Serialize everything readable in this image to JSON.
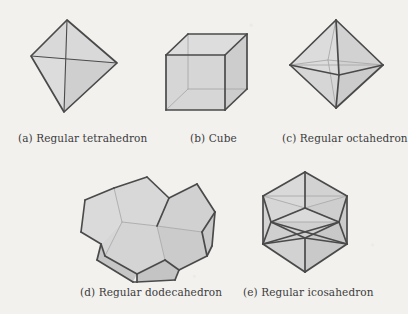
{
  "figure": {
    "kind": "platonic-solids-plate",
    "background_color": "#f2f1ee",
    "face_fill_color": "#d4d4d4",
    "face_fill_light_color": "#dcdcdc",
    "edge_color": "#4a4a4a",
    "hidden_edge_color": "#a9a9a9",
    "caption_color": "#3c3c3c"
  },
  "panels": [
    {
      "id": "tetrahedron",
      "label": "(a) Regular tetrahedron",
      "caption_x": 18,
      "caption_y": 132,
      "svg": {
        "x": 18,
        "y": 12,
        "w": 110,
        "h": 110
      },
      "faces": [
        {
          "points": "49,8 13,44 46,100",
          "shade": "#dcdcdc"
        },
        {
          "points": "49,8 46,100 99,51",
          "shade": "#cfcfcf"
        },
        {
          "points": "49,8 13,44 99,51",
          "shade": "#d9d9d9"
        }
      ],
      "inner_edges": [
        {
          "x1": 13,
          "y1": 44,
          "x2": 99,
          "y2": 51
        },
        {
          "x1": 49,
          "y1": 8,
          "x2": 46,
          "y2": 100
        }
      ],
      "outline": "49,8 13,44 46,100 99,51"
    },
    {
      "id": "cube",
      "label": "(b) Cube",
      "caption_x": 190,
      "caption_y": 132,
      "svg": {
        "x": 155,
        "y": 12,
        "w": 110,
        "h": 110
      },
      "faces": [
        {
          "points": "11,43 70,43 70,98 11,98",
          "shade": "#d6d6d6"
        },
        {
          "points": "11,43 33,22 92,22 70,43",
          "shade": "#dddddd"
        },
        {
          "points": "70,43 92,22 92,77 70,98",
          "shade": "#cdcdcd"
        }
      ],
      "hidden_edges": [
        {
          "x1": 33,
          "y1": 22,
          "x2": 33,
          "y2": 77
        },
        {
          "x1": 33,
          "y1": 77,
          "x2": 92,
          "y2": 77
        },
        {
          "x1": 33,
          "y1": 77,
          "x2": 11,
          "y2": 98
        }
      ],
      "edges": [
        {
          "x1": 11,
          "y1": 43,
          "x2": 70,
          "y2": 43
        },
        {
          "x1": 70,
          "y1": 43,
          "x2": 70,
          "y2": 98
        },
        {
          "x1": 70,
          "y1": 98,
          "x2": 11,
          "y2": 98
        },
        {
          "x1": 11,
          "y1": 98,
          "x2": 11,
          "y2": 43
        },
        {
          "x1": 11,
          "y1": 43,
          "x2": 33,
          "y2": 22
        },
        {
          "x1": 33,
          "y1": 22,
          "x2": 92,
          "y2": 22
        },
        {
          "x1": 92,
          "y1": 22,
          "x2": 92,
          "y2": 77
        },
        {
          "x1": 92,
          "y1": 77,
          "x2": 70,
          "y2": 98
        },
        {
          "x1": 70,
          "y1": 43,
          "x2": 92,
          "y2": 22
        }
      ]
    },
    {
      "id": "octahedron",
      "label": "(c) Regular octahedron",
      "caption_x": 282,
      "caption_y": 132,
      "svg": {
        "x": 282,
        "y": 12,
        "w": 110,
        "h": 110
      },
      "faces": [
        {
          "points": "54,8 8,53 57,63",
          "shade": "#dcdcdc"
        },
        {
          "points": "54,8 101,53 57,63",
          "shade": "#d2d2d2"
        },
        {
          "points": "54,96 8,53 57,63",
          "shade": "#d6d6d6"
        },
        {
          "points": "54,96 101,53 57,63",
          "shade": "#cccccc"
        }
      ],
      "hidden_edges": [
        {
          "x1": 8,
          "y1": 53,
          "x2": 101,
          "y2": 53
        },
        {
          "x1": 54,
          "y1": 8,
          "x2": 46,
          "y2": 48
        },
        {
          "x1": 54,
          "y1": 96,
          "x2": 46,
          "y2": 48
        },
        {
          "x1": 8,
          "y1": 53,
          "x2": 46,
          "y2": 48
        },
        {
          "x1": 101,
          "y1": 53,
          "x2": 46,
          "y2": 48
        }
      ],
      "edges": [
        {
          "x1": 54,
          "y1": 8,
          "x2": 8,
          "y2": 53
        },
        {
          "x1": 54,
          "y1": 8,
          "x2": 101,
          "y2": 53
        },
        {
          "x1": 54,
          "y1": 96,
          "x2": 8,
          "y2": 53
        },
        {
          "x1": 54,
          "y1": 96,
          "x2": 101,
          "y2": 53
        },
        {
          "x1": 54,
          "y1": 8,
          "x2": 57,
          "y2": 63
        },
        {
          "x1": 54,
          "y1": 96,
          "x2": 57,
          "y2": 63
        },
        {
          "x1": 8,
          "y1": 53,
          "x2": 57,
          "y2": 63
        },
        {
          "x1": 101,
          "y1": 53,
          "x2": 57,
          "y2": 63
        }
      ]
    },
    {
      "id": "dodecahedron",
      "label": "(d) Regular dodecahedron",
      "caption_x": 80,
      "caption_y": 286,
      "svg": {
        "x": 75,
        "y": 160,
        "w": 125,
        "h": 125
      },
      "faces": [
        {
          "points": "39,28 72,17 94,38 82,66 47,62",
          "shade": "#d8d8d8"
        },
        {
          "points": "94,38 122,24 140,52 127,72 82,66",
          "shade": "#d1d1d1"
        },
        {
          "points": "39,28 47,62 26,84 6,72 10,40",
          "shade": "#dadada"
        },
        {
          "points": "47,62 82,66 90,100 62,114 30,96",
          "shade": "#d4d4d4"
        },
        {
          "points": "82,66 127,72 132,96 104,110 90,100",
          "shade": "#cbcbcb"
        },
        {
          "points": "47,62 30,96 26,84",
          "shade": "#d6d6d6"
        },
        {
          "points": "26,84 30,96 62,114 58,122 22,100",
          "shade": "#c6c6c6"
        },
        {
          "points": "90,100 104,110 100,120 62,122 62,114",
          "shade": "#c4c4c4"
        },
        {
          "points": "127,72 140,52 137,86 132,96",
          "shade": "#c9c9c9"
        }
      ],
      "hidden_edges": [
        {
          "x1": 39,
          "y1": 28,
          "x2": 47,
          "y2": 62
        },
        {
          "x1": 47,
          "y1": 62,
          "x2": 82,
          "y2": 66
        },
        {
          "x1": 82,
          "y1": 66,
          "x2": 94,
          "y2": 38
        },
        {
          "x1": 82,
          "y1": 66,
          "x2": 127,
          "y2": 72
        },
        {
          "x1": 47,
          "y1": 62,
          "x2": 30,
          "y2": 96
        },
        {
          "x1": 90,
          "y1": 100,
          "x2": 82,
          "y2": 66
        }
      ],
      "edges": [
        {
          "x1": 39,
          "y1": 28,
          "x2": 72,
          "y2": 17
        },
        {
          "x1": 72,
          "y1": 17,
          "x2": 94,
          "y2": 38
        },
        {
          "x1": 94,
          "y1": 38,
          "x2": 122,
          "y2": 24
        },
        {
          "x1": 122,
          "y1": 24,
          "x2": 140,
          "y2": 52
        },
        {
          "x1": 140,
          "y1": 52,
          "x2": 137,
          "y2": 86
        },
        {
          "x1": 137,
          "y1": 86,
          "x2": 132,
          "y2": 96
        },
        {
          "x1": 132,
          "y1": 96,
          "x2": 104,
          "y2": 110
        },
        {
          "x1": 104,
          "y1": 110,
          "x2": 100,
          "y2": 120
        },
        {
          "x1": 100,
          "y1": 120,
          "x2": 62,
          "y2": 122
        },
        {
          "x1": 62,
          "y1": 122,
          "x2": 58,
          "y2": 122
        },
        {
          "x1": 58,
          "y1": 122,
          "x2": 22,
          "y2": 100
        },
        {
          "x1": 22,
          "y1": 100,
          "x2": 26,
          "y2": 84
        },
        {
          "x1": 26,
          "y1": 84,
          "x2": 6,
          "y2": 72
        },
        {
          "x1": 6,
          "y1": 72,
          "x2": 10,
          "y2": 40
        },
        {
          "x1": 10,
          "y1": 40,
          "x2": 39,
          "y2": 28
        },
        {
          "x1": 26,
          "y1": 84,
          "x2": 30,
          "y2": 96
        },
        {
          "x1": 30,
          "y1": 96,
          "x2": 62,
          "y2": 114
        },
        {
          "x1": 62,
          "y1": 114,
          "x2": 90,
          "y2": 100
        },
        {
          "x1": 90,
          "y1": 100,
          "x2": 104,
          "y2": 110
        },
        {
          "x1": 62,
          "y1": 114,
          "x2": 62,
          "y2": 122
        },
        {
          "x1": 127,
          "y1": 72,
          "x2": 132,
          "y2": 96
        },
        {
          "x1": 127,
          "y1": 72,
          "x2": 140,
          "y2": 52
        },
        {
          "x1": 94,
          "y1": 38,
          "x2": 82,
          "y2": 66
        }
      ]
    },
    {
      "id": "icosahedron",
      "label": "(e) Regular icosahedron",
      "caption_x": 243,
      "caption_y": 286,
      "svg": {
        "x": 243,
        "y": 160,
        "w": 125,
        "h": 125
      },
      "faces": [
        {
          "points": "62,12 20,36 62,48",
          "shade": "#d9d9d9"
        },
        {
          "points": "62,12 104,36 62,48",
          "shade": "#d2d2d2"
        },
        {
          "points": "20,36 62,48 28,62",
          "shade": "#d6d6d6"
        },
        {
          "points": "104,36 62,48 96,62",
          "shade": "#cecece"
        },
        {
          "points": "28,62 62,48 96,62",
          "shade": "#dadada"
        },
        {
          "points": "20,36 28,62 20,84",
          "shade": "#d4d4d4"
        },
        {
          "points": "104,36 96,62 104,84",
          "shade": "#cbcbcb"
        },
        {
          "points": "28,62 96,62 62,78",
          "shade": "#d0d0d0"
        },
        {
          "points": "20,84 28,62 62,78",
          "shade": "#cfcfcf"
        },
        {
          "points": "104,84 96,62 62,78",
          "shade": "#c8c8c8"
        },
        {
          "points": "20,84 62,78 62,112",
          "shade": "#d2d2d2"
        },
        {
          "points": "104,84 62,78 62,112",
          "shade": "#c9c9c9"
        }
      ],
      "hidden_edges": [
        {
          "x1": 20,
          "y1": 36,
          "x2": 104,
          "y2": 36
        },
        {
          "x1": 28,
          "y1": 62,
          "x2": 96,
          "y2": 62
        },
        {
          "x1": 20,
          "y1": 36,
          "x2": 62,
          "y2": 48
        },
        {
          "x1": 104,
          "y1": 36,
          "x2": 62,
          "y2": 48
        },
        {
          "x1": 62,
          "y1": 48,
          "x2": 28,
          "y2": 62
        },
        {
          "x1": 62,
          "y1": 48,
          "x2": 96,
          "y2": 62
        }
      ],
      "edges": [
        {
          "x1": 62,
          "y1": 12,
          "x2": 20,
          "y2": 36
        },
        {
          "x1": 62,
          "y1": 12,
          "x2": 104,
          "y2": 36
        },
        {
          "x1": 20,
          "y1": 36,
          "x2": 20,
          "y2": 84
        },
        {
          "x1": 104,
          "y1": 36,
          "x2": 104,
          "y2": 84
        },
        {
          "x1": 20,
          "y1": 84,
          "x2": 62,
          "y2": 112
        },
        {
          "x1": 104,
          "y1": 84,
          "x2": 62,
          "y2": 112
        },
        {
          "x1": 62,
          "y1": 12,
          "x2": 62,
          "y2": 48
        },
        {
          "x1": 20,
          "y1": 36,
          "x2": 28,
          "y2": 62
        },
        {
          "x1": 104,
          "y1": 36,
          "x2": 96,
          "y2": 62
        },
        {
          "x1": 28,
          "y1": 62,
          "x2": 20,
          "y2": 84
        },
        {
          "x1": 96,
          "y1": 62,
          "x2": 104,
          "y2": 84
        },
        {
          "x1": 28,
          "y1": 62,
          "x2": 62,
          "y2": 78
        },
        {
          "x1": 96,
          "y1": 62,
          "x2": 62,
          "y2": 78
        },
        {
          "x1": 20,
          "y1": 84,
          "x2": 62,
          "y2": 78
        },
        {
          "x1": 104,
          "y1": 84,
          "x2": 62,
          "y2": 78
        },
        {
          "x1": 62,
          "y1": 78,
          "x2": 62,
          "y2": 112
        },
        {
          "x1": 62,
          "y1": 48,
          "x2": 28,
          "y2": 62
        },
        {
          "x1": 62,
          "y1": 48,
          "x2": 96,
          "y2": 62
        },
        {
          "x1": 20,
          "y1": 84,
          "x2": 96,
          "y2": 62
        },
        {
          "x1": 104,
          "y1": 84,
          "x2": 28,
          "y2": 62
        }
      ]
    }
  ]
}
